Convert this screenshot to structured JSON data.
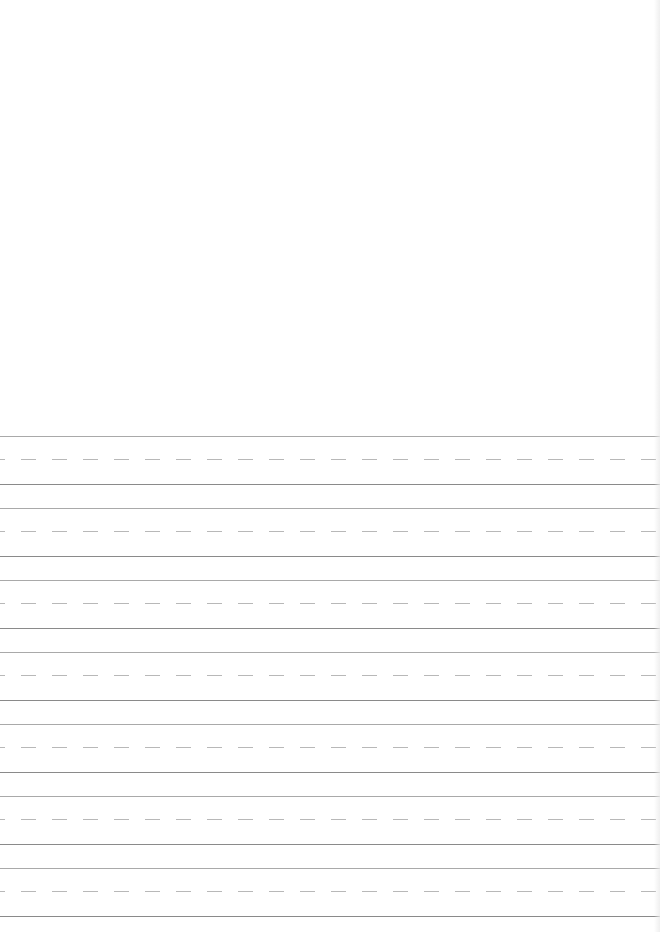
{
  "page": {
    "type": "handwriting-practice-sheet",
    "drawing_area": {
      "label": ""
    },
    "colors": {
      "background": "#ffffff",
      "top_line": "#a9a9a9",
      "midline_dashed": "#b8b8b8",
      "baseline": "#8a8a8a"
    },
    "writing_rows": [
      {
        "index": 1,
        "text": ""
      },
      {
        "index": 2,
        "text": ""
      },
      {
        "index": 3,
        "text": ""
      },
      {
        "index": 4,
        "text": ""
      },
      {
        "index": 5,
        "text": ""
      },
      {
        "index": 6,
        "text": ""
      },
      {
        "index": 7,
        "text": ""
      }
    ]
  }
}
